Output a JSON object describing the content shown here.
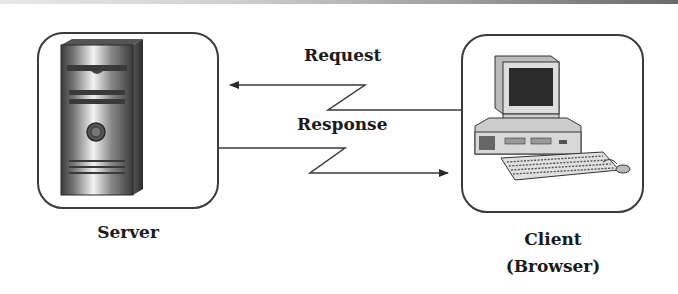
{
  "diagram": {
    "nodes": [
      {
        "id": "server",
        "label": "Server",
        "icon": "server-tower-icon"
      },
      {
        "id": "client",
        "label_line1": "Client",
        "label_line2": "(Browser)",
        "icon": "desktop-computer-icon"
      }
    ],
    "edges": [
      {
        "id": "request",
        "label": "Request",
        "from": "client",
        "to": "server",
        "style": "zigzag-arrow"
      },
      {
        "id": "response",
        "label": "Response",
        "from": "server",
        "to": "client",
        "style": "zigzag-arrow"
      }
    ],
    "colors": {
      "stroke": "#3a3a3a",
      "text": "#1a1a1a",
      "background": "#ffffff"
    }
  }
}
